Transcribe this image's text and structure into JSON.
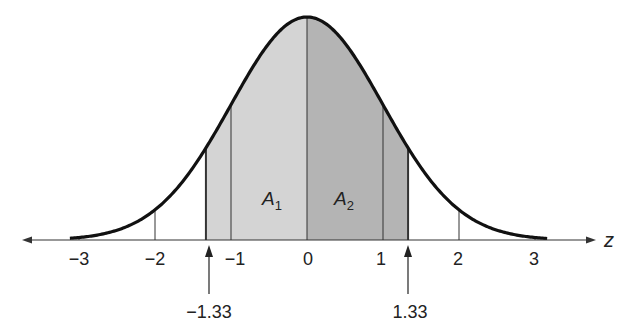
{
  "chart_data": {
    "type": "area",
    "title": "",
    "xlabel": "z",
    "ylabel": "",
    "xlim": [
      -3.5,
      3.5
    ],
    "grid": false,
    "tick_labels": [
      "−3",
      "−2",
      "−1",
      "0",
      "1",
      "2",
      "3"
    ],
    "ticks": [
      -3,
      -2,
      -1,
      0,
      1,
      2,
      3
    ],
    "shaded_regions": [
      {
        "name": "A1",
        "from": -1.33,
        "to": 0,
        "color": "#d4d4d4"
      },
      {
        "name": "A2",
        "from": 0,
        "to": 1.33,
        "color": "#b4b4b4"
      }
    ],
    "markers": [
      {
        "value": -1.33,
        "label": "−1.33"
      },
      {
        "value": 1.33,
        "label": "1.33"
      }
    ],
    "annotations": [
      {
        "text": "A1",
        "main": "A",
        "sub": "1"
      },
      {
        "text": "A2",
        "main": "A",
        "sub": "2"
      }
    ]
  },
  "labels": {
    "axis": "z",
    "ticks": [
      "−3",
      "−2",
      "−1",
      "0",
      "1",
      "2",
      "3"
    ],
    "marker_left": "−1.33",
    "marker_right": "1.33",
    "a1_main": "A",
    "a1_sub": "1",
    "a2_main": "A",
    "a2_sub": "2"
  },
  "colors": {
    "left_fill": "#d4d4d4",
    "right_fill": "#b4b4b4",
    "curve": "#111111"
  }
}
